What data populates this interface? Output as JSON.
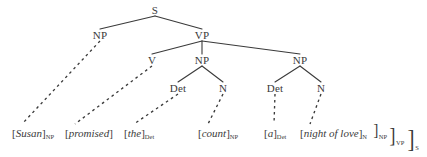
{
  "diagram": {
    "type": "syntactic-tree",
    "title": "",
    "sentence": "Susan promised the count a night of love",
    "colors": {
      "ink": "#3a3a3a",
      "background": "#ffffff",
      "solid_edge": "#3a3a3a",
      "dashed_edge": "#3a3a3a"
    },
    "nodes": [
      {
        "id": "S",
        "label": "S",
        "x": 155,
        "y": 10
      },
      {
        "id": "NP1",
        "label": "NP",
        "x": 100,
        "y": 35
      },
      {
        "id": "VP",
        "label": "VP",
        "x": 202,
        "y": 35
      },
      {
        "id": "V",
        "label": "V",
        "x": 152,
        "y": 60
      },
      {
        "id": "NP2",
        "label": "NP",
        "x": 202,
        "y": 60
      },
      {
        "id": "NP3",
        "label": "NP",
        "x": 300,
        "y": 60
      },
      {
        "id": "Det1",
        "label": "Det",
        "x": 178,
        "y": 88
      },
      {
        "id": "N1",
        "label": "N",
        "x": 223,
        "y": 88
      },
      {
        "id": "Det2",
        "label": "Det",
        "x": 275,
        "y": 88
      },
      {
        "id": "N2",
        "label": "N",
        "x": 321,
        "y": 88
      }
    ],
    "solid_edges": [
      {
        "from": "S",
        "to": "NP1"
      },
      {
        "from": "S",
        "to": "VP"
      },
      {
        "from": "VP",
        "to": "V"
      },
      {
        "from": "VP",
        "to": "NP2"
      },
      {
        "from": "VP",
        "to": "NP3"
      },
      {
        "from": "NP2",
        "to": "Det1"
      },
      {
        "from": "NP2",
        "to": "N1"
      },
      {
        "from": "NP3",
        "to": "Det2"
      },
      {
        "from": "NP3",
        "to": "N2"
      }
    ],
    "dashed_edges": [
      {
        "from": "NP1",
        "to_terminal": "susan"
      },
      {
        "from": "V",
        "to_terminal": "promised"
      },
      {
        "from": "Det1",
        "to_terminal": "the"
      },
      {
        "from": "N1",
        "to_terminal": "count"
      },
      {
        "from": "Det2",
        "to_terminal": "a"
      },
      {
        "from": "N2",
        "to_terminal": "night-of-love"
      }
    ],
    "terminals": [
      {
        "id": "susan",
        "open": "[",
        "word": "Susan",
        "close": "]",
        "subscript": "NP",
        "x": 12,
        "y": 133
      },
      {
        "id": "promised",
        "open": "[",
        "word": "promised",
        "close": "]",
        "subscript": "",
        "x": 65,
        "y": 133
      },
      {
        "id": "the",
        "open": "[",
        "word": "the",
        "close": "]",
        "subscript": "Det",
        "x": 124,
        "y": 133
      },
      {
        "id": "count",
        "open": "[",
        "word": "count",
        "close": "]",
        "subscript": "NP",
        "x": 198,
        "y": 133
      },
      {
        "id": "a",
        "open": "[",
        "word": "a",
        "close": "]",
        "subscript": "Det",
        "x": 264,
        "y": 133
      },
      {
        "id": "night-of-love",
        "open": "[",
        "word": "night of love",
        "close": "]",
        "subscript": "N",
        "x": 300,
        "y": 133
      }
    ],
    "closing_brackets": [
      {
        "id": "close-np",
        "bracket": "]",
        "subscript": "NP",
        "x": 373,
        "y": 131,
        "height": 17
      },
      {
        "id": "close-vp",
        "bracket": "]",
        "subscript": "VP",
        "x": 389,
        "y": 135,
        "height": 21
      },
      {
        "id": "close-s",
        "bracket": "]",
        "subscript": "S",
        "x": 407,
        "y": 139,
        "height": 25
      }
    ]
  }
}
